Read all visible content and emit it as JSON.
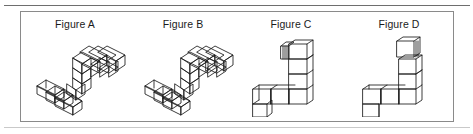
{
  "document": {
    "type": "spatial-reasoning-figure-comparison",
    "panel_border_color": "#8a8a8a",
    "rule_color": "#6e6e6e",
    "ink_color": "#1b1b1b",
    "background_color": "#ffffff"
  },
  "panel": {
    "figures": [
      {
        "id": "A",
        "label": "Figure A",
        "shape_name": "z-shaped-block-chain",
        "view": "isometric",
        "cube_count": 10,
        "description": "Z/S shaped chain of cubes drawn in isometric projection, rising from lower-left to upper-right with a flat foot at the bottom left"
      },
      {
        "id": "B",
        "label": "Figure B",
        "shape_name": "z-shaped-block-chain",
        "view": "isometric",
        "cube_count": 10,
        "description": "Z/S shaped chain of cubes drawn in isometric projection, identical orientation to Figure A"
      },
      {
        "id": "C",
        "label": "Figure C",
        "shape_name": "l-shaped-block-chain",
        "view": "near-frontal",
        "cube_count": 8,
        "description": "L shaped chain of cubes seen nearly face on, vertical arm at the right and horizontal arm running left along the bottom"
      },
      {
        "id": "D",
        "label": "Figure D",
        "shape_name": "l-shaped-block-chain",
        "view": "near-frontal",
        "cube_count": 8,
        "description": "L shaped chain of cubes seen nearly face on, mirrored relative to Figure C with a stepped cube at the top"
      }
    ]
  }
}
